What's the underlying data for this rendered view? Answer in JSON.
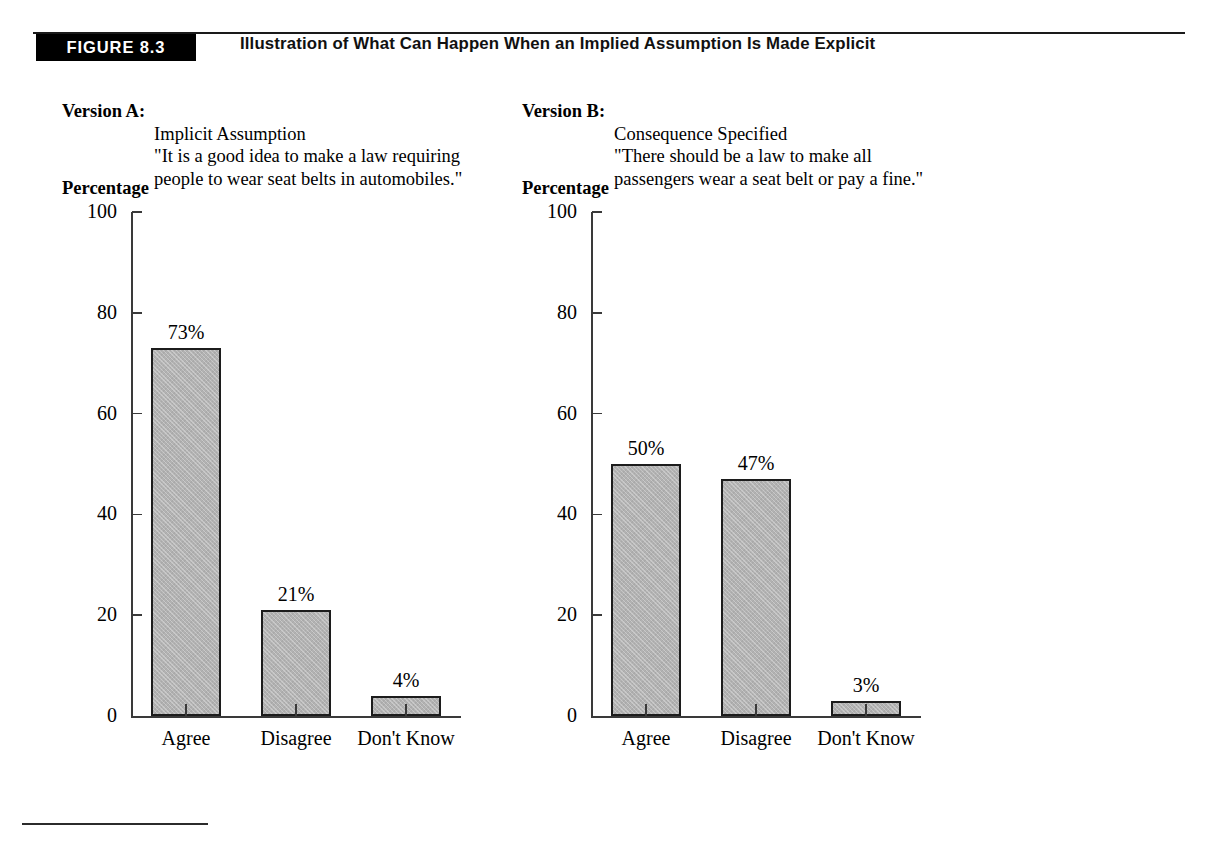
{
  "figure": {
    "badge": "FIGURE 8.3",
    "title": "Illustration of What Can Happen When an Implied Assumption Is Made Explicit"
  },
  "versions": [
    {
      "label": "Version A:",
      "heading": "Implicit Assumption",
      "quote": "\"It is a good idea to make a law requiring\npeople to wear seat belts in automobiles.\""
    },
    {
      "label": "Version B:",
      "heading": "Consequence Specified",
      "quote": "\"There should be a law to make all\npassengers wear a seat belt or pay a fine.\""
    }
  ],
  "colors": {
    "bar_fill": "#b2b2b2",
    "bar_border": "#1c1c1c",
    "axis": "#3a3a3a",
    "badge_background": "#000000",
    "badge_text": "#ffffff"
  },
  "chart_data": [
    {
      "type": "bar",
      "title": "Version A: Implicit Assumption",
      "ylabel": "Percentage",
      "xlabel": "",
      "categories": [
        "Agree",
        "Disagree",
        "Don't Know"
      ],
      "values": [
        73,
        21,
        4
      ],
      "value_labels": [
        "73%",
        "21%",
        "4%"
      ],
      "ylim": [
        0,
        100
      ],
      "yticks": [
        0,
        20,
        40,
        60,
        80,
        100
      ],
      "ytick_labels": [
        "0",
        "20",
        "40",
        "60",
        "80",
        "100"
      ],
      "grid": false,
      "legend": "none"
    },
    {
      "type": "bar",
      "title": "Version B: Consequence Specified",
      "ylabel": "Percentage",
      "xlabel": "",
      "categories": [
        "Agree",
        "Disagree",
        "Don't Know"
      ],
      "values": [
        50,
        47,
        3
      ],
      "value_labels": [
        "50%",
        "47%",
        "3%"
      ],
      "ylim": [
        0,
        100
      ],
      "yticks": [
        0,
        20,
        40,
        60,
        80,
        100
      ],
      "ytick_labels": [
        "0",
        "20",
        "40",
        "60",
        "80",
        "100"
      ],
      "grid": false,
      "legend": "none"
    }
  ]
}
